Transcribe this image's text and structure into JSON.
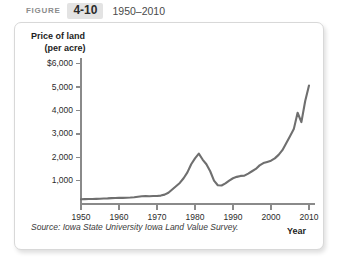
{
  "header": {
    "figure_word": "FIGURE",
    "figure_number": "4-10",
    "figure_range": "1950–2010"
  },
  "source_note": "Source: Iowa State University Iowa Land Value Survey.",
  "colors": {
    "line": "#6f6f6f",
    "axis": "#8a8a8a",
    "panel_border": "#d8d8d8",
    "badge_bg": "#e3e3e3",
    "text": "#1d1d1d"
  },
  "chart_data": {
    "type": "line",
    "title": "",
    "xlabel": "Year",
    "ylabel": "Price of land (per acre)",
    "ylabel_line1": "Price of land",
    "ylabel_line2": "(per acre)",
    "xlim": [
      1950,
      2010
    ],
    "ylim": [
      0,
      6000
    ],
    "xticks": [
      1950,
      1960,
      1970,
      1980,
      1990,
      2000,
      2010
    ],
    "xtick_labels": [
      "1950",
      "1960",
      "1970",
      "1980",
      "1990",
      "2000",
      "2010"
    ],
    "yticks": [
      1000,
      2000,
      3000,
      4000,
      5000,
      6000
    ],
    "ytick_labels": [
      "1,000",
      "2,000",
      "3,000",
      "4,000",
      "5,000",
      "$6,000"
    ],
    "grid": false,
    "legend": null,
    "series": [
      {
        "name": "Iowa farmland price per acre",
        "x": [
          1950,
          1951,
          1952,
          1953,
          1954,
          1955,
          1956,
          1957,
          1958,
          1959,
          1960,
          1961,
          1962,
          1963,
          1964,
          1965,
          1966,
          1967,
          1968,
          1969,
          1970,
          1971,
          1972,
          1973,
          1974,
          1975,
          1976,
          1977,
          1978,
          1979,
          1980,
          1981,
          1982,
          1983,
          1984,
          1985,
          1986,
          1987,
          1988,
          1989,
          1990,
          1991,
          1992,
          1993,
          1994,
          1995,
          1996,
          1997,
          1998,
          1999,
          2000,
          2001,
          2002,
          2003,
          2004,
          2005,
          2006,
          2007,
          2008,
          2009,
          2010
        ],
        "values": [
          200,
          210,
          215,
          215,
          220,
          225,
          235,
          240,
          250,
          255,
          260,
          260,
          265,
          275,
          290,
          310,
          330,
          335,
          330,
          340,
          345,
          360,
          400,
          480,
          620,
          760,
          900,
          1100,
          1350,
          1700,
          1950,
          2150,
          1900,
          1700,
          1400,
          1000,
          800,
          790,
          880,
          1000,
          1100,
          1160,
          1200,
          1210,
          1300,
          1400,
          1500,
          1650,
          1750,
          1800,
          1850,
          1950,
          2100,
          2300,
          2600,
          2900,
          3200,
          3900,
          3500,
          4400,
          5060
        ]
      }
    ],
    "annotations": []
  }
}
